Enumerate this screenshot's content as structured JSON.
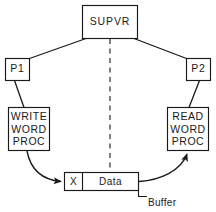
{
  "diagram": {
    "colors": {
      "stroke": "#1a1a1a",
      "fill": "#ffffff",
      "dashed": "#555555",
      "background": "#ffffff"
    },
    "nodes": {
      "supervisor": {
        "label": "SUPVR"
      },
      "process_left": {
        "label": "P1"
      },
      "process_right": {
        "label": "P2"
      },
      "write_proc": {
        "line1": "WRITE",
        "line2": "WORD",
        "line3": "PROC"
      },
      "read_proc": {
        "line1": "READ",
        "line2": "WORD",
        "line3": "PROC"
      },
      "buffer": {
        "flag_cell": "X",
        "data_cell": "Data",
        "annotation": "Buffer"
      }
    },
    "edges": [
      {
        "from": "supervisor",
        "to": "process_left",
        "style": "solid"
      },
      {
        "from": "supervisor",
        "to": "process_right",
        "style": "solid"
      },
      {
        "from": "process_left",
        "to": "write_proc",
        "style": "solid"
      },
      {
        "from": "process_right",
        "to": "read_proc",
        "style": "solid"
      },
      {
        "from": "supervisor",
        "to": "buffer",
        "style": "dashed"
      },
      {
        "from": "write_proc",
        "to": "buffer",
        "style": "curved-arrow"
      },
      {
        "from": "buffer",
        "to": "read_proc",
        "style": "curved-arrow"
      }
    ]
  }
}
